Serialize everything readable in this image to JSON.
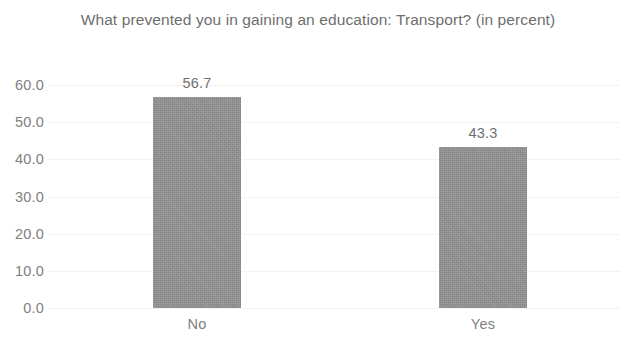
{
  "chart_data": {
    "type": "bar",
    "title": "What prevented you in gaining an education: Transport? (in percent)",
    "xlabel": "",
    "ylabel": "",
    "categories": [
      "No",
      "Yes"
    ],
    "values": [
      56.7,
      43.3
    ],
    "data_labels": [
      "56.7",
      "43.3"
    ],
    "ylim": [
      0,
      60
    ],
    "y_ticks": [
      0,
      10,
      20,
      30,
      40,
      50,
      60
    ],
    "y_tick_labels": [
      "0.0",
      "10.0",
      "20.0",
      "30.0",
      "40.0",
      "50.0",
      "60.0"
    ],
    "grid": true,
    "grid_axis": "y",
    "legend": false,
    "legend_position": "none",
    "bar_color": "#949494",
    "text_color": "#6e6e6e",
    "gridline_color": "#f2f2f2",
    "background_color": "#ffffff"
  }
}
